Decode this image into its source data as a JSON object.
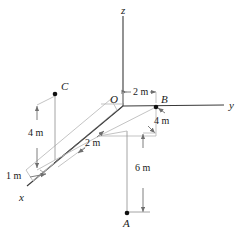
{
  "figure": {
    "kind": "3d-coordinate-diagram",
    "width": 242,
    "height": 239,
    "background_color": "#ffffff",
    "line_color": "#3a3a3a",
    "faint_line_color": "#b9b9b9",
    "text_color": "#1a1a1a"
  },
  "axes": [
    {
      "id": "z",
      "label": "z",
      "direction": "up",
      "label_x": 124,
      "label_y": 6
    },
    {
      "id": "y",
      "label": "y",
      "direction": "right",
      "label_x": 229,
      "label_y": 101
    },
    {
      "id": "x",
      "label": "x",
      "direction": "lower-left",
      "label_x": 19,
      "label_y": 193
    }
  ],
  "origin": {
    "label": "O",
    "x": 123,
    "y": 105,
    "label_x": 111,
    "label_y": 95
  },
  "points": [
    {
      "id": "A",
      "label": "A",
      "x": 127,
      "y": 213,
      "label_x": 123,
      "label_y": 219
    },
    {
      "id": "B",
      "label": "B",
      "x": 156,
      "y": 107,
      "label_x": 161,
      "label_y": 95
    },
    {
      "id": "C",
      "label": "C",
      "x": 55,
      "y": 94,
      "label_x": 61,
      "label_y": 82
    }
  ],
  "dimensions": [
    {
      "id": "dim-2m-top",
      "label": "2 m",
      "x": 136,
      "y": 92,
      "orientation": "horizontal"
    },
    {
      "id": "dim-4m-right",
      "label": "4 m",
      "x": 155,
      "y": 116,
      "orientation": "diagonal"
    },
    {
      "id": "dim-6m",
      "label": "6 m",
      "x": 136,
      "y": 168,
      "orientation": "vertical"
    },
    {
      "id": "dim-2m-middle",
      "label": "2 m",
      "x": 86,
      "y": 139,
      "orientation": "diagonal"
    },
    {
      "id": "dim-4m-left",
      "label": "4 m",
      "x": 29,
      "y": 128,
      "orientation": "vertical"
    },
    {
      "id": "dim-1m",
      "label": "1 m",
      "x": 8,
      "y": 172,
      "orientation": "diagonal"
    }
  ]
}
